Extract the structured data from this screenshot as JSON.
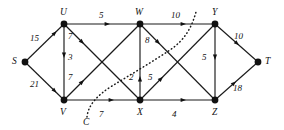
{
  "figure": {
    "kind": "flow-network-graph",
    "background_color": "#ffffff",
    "ink_color": "#111111"
  },
  "nodes": [
    {
      "id": "S",
      "label": "S",
      "x": 25,
      "y": 62
    },
    {
      "id": "U",
      "label": "U",
      "x": 64,
      "y": 24
    },
    {
      "id": "V",
      "label": "V",
      "x": 64,
      "y": 100
    },
    {
      "id": "W",
      "label": "W",
      "x": 140,
      "y": 24
    },
    {
      "id": "X",
      "label": "X",
      "x": 140,
      "y": 100
    },
    {
      "id": "Y",
      "label": "Y",
      "x": 215,
      "y": 24
    },
    {
      "id": "Z",
      "label": "Z",
      "x": 215,
      "y": 100
    },
    {
      "id": "T",
      "label": "T",
      "x": 258,
      "y": 62
    }
  ],
  "edges": [
    {
      "from": "S",
      "to": "U",
      "weight": "15",
      "label_x": 33,
      "label_y": 35
    },
    {
      "from": "S",
      "to": "V",
      "weight": "21",
      "label_x": 33,
      "label_y": 82
    },
    {
      "from": "U",
      "to": "W",
      "weight": "5",
      "label_x": 100,
      "label_y": 12
    },
    {
      "from": "U",
      "to": "V",
      "weight": "3",
      "label_x": 69,
      "label_y": 58
    },
    {
      "from": "U",
      "to": "X",
      "weight": "7",
      "label_x": 69,
      "label_y": 36
    },
    {
      "from": "V",
      "to": "W",
      "weight": "7",
      "label_x": 69,
      "label_y": 77
    },
    {
      "from": "V",
      "to": "X",
      "weight": "7",
      "label_x": 100,
      "label_y": 110
    },
    {
      "from": "W",
      "to": "Y",
      "weight": "10",
      "label_x": 174,
      "label_y": 12
    },
    {
      "from": "W",
      "to": "Z",
      "weight": "8",
      "label_x": 146,
      "label_y": 40
    },
    {
      "from": "X",
      "to": "W",
      "weight": "2",
      "label_x": 131,
      "label_y": 77
    },
    {
      "from": "X",
      "to": "Y",
      "weight": "5",
      "label_x": 148,
      "label_y": 77
    },
    {
      "from": "X",
      "to": "Z",
      "weight": "4",
      "label_x": 174,
      "label_y": 110
    },
    {
      "from": "Y",
      "to": "Z",
      "weight": "5",
      "label_x": 204,
      "label_y": 58
    },
    {
      "from": "Y",
      "to": "T",
      "weight": "10",
      "label_x": 235,
      "label_y": 35
    },
    {
      "from": "Z",
      "to": "T",
      "weight": "18",
      "label_x": 235,
      "label_y": 86
    }
  ],
  "cut": {
    "label": "C",
    "label_x": 85,
    "label_y": 120
  }
}
